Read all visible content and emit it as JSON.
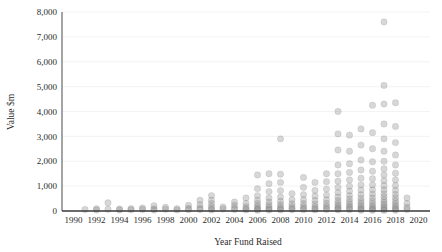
{
  "chart_data": {
    "type": "scatter",
    "title": "",
    "subtitle": "",
    "xlabel": "Year Fund Raised",
    "ylabel": "Value $m",
    "xlim": [
      1989,
      2021
    ],
    "ylim": [
      0,
      8000
    ],
    "xticks": [
      1990,
      1992,
      1994,
      1996,
      1998,
      2000,
      2002,
      2004,
      2006,
      2008,
      2010,
      2012,
      2014,
      2016,
      2018,
      2020
    ],
    "xtick_labels": [
      "1990",
      "1992",
      "1994",
      "1996",
      "1998",
      "2000",
      "2002",
      "2004",
      "2006",
      "2008",
      "2010",
      "2012",
      "2014",
      "2016",
      "2018",
      "2020"
    ],
    "yticks": [
      0,
      1000,
      2000,
      3000,
      4000,
      5000,
      6000,
      7000,
      8000
    ],
    "ytick_labels": [
      "0",
      "1,000",
      "2,000",
      "3,000",
      "4,000",
      "5,000",
      "6,000",
      "7,000",
      "8,000"
    ],
    "grid": true,
    "grid_axis": "y",
    "legend": false,
    "legend_position": "none",
    "marker": {
      "shape": "circle",
      "radius": 3.2,
      "fill": "#8a8a8a",
      "fill_opacity": 0.34,
      "stroke": "#707070"
    },
    "colors": {
      "marker": "#8a8a8a",
      "axis": "#3a3a3a",
      "grid": "#f0f0f0",
      "text": "#2b2b2b",
      "background": "#ffffff"
    },
    "series": [
      {
        "name": "Funds",
        "points": [
          [
            1991,
            60
          ],
          [
            1992,
            90
          ],
          [
            1992,
            40
          ],
          [
            1993,
            330
          ],
          [
            1993,
            70
          ],
          [
            1994,
            80
          ],
          [
            1994,
            45
          ],
          [
            1995,
            95
          ],
          [
            1995,
            50
          ],
          [
            1996,
            120
          ],
          [
            1996,
            60
          ],
          [
            1997,
            210
          ],
          [
            1997,
            80
          ],
          [
            1997,
            40
          ],
          [
            1998,
            150
          ],
          [
            1998,
            70
          ],
          [
            1999,
            95
          ],
          [
            1999,
            45
          ],
          [
            2000,
            230
          ],
          [
            2000,
            110
          ],
          [
            2000,
            55
          ],
          [
            2001,
            430
          ],
          [
            2001,
            250
          ],
          [
            2001,
            120
          ],
          [
            2001,
            60
          ],
          [
            2002,
            620
          ],
          [
            2002,
            430
          ],
          [
            2002,
            300
          ],
          [
            2002,
            180
          ],
          [
            2002,
            90
          ],
          [
            2002,
            45
          ],
          [
            2003,
            160
          ],
          [
            2003,
            80
          ],
          [
            2004,
            360
          ],
          [
            2004,
            230
          ],
          [
            2004,
            120
          ],
          [
            2004,
            60
          ],
          [
            2005,
            520
          ],
          [
            2005,
            300
          ],
          [
            2005,
            170
          ],
          [
            2005,
            90
          ],
          [
            2005,
            45
          ],
          [
            2006,
            1450
          ],
          [
            2006,
            900
          ],
          [
            2006,
            620
          ],
          [
            2006,
            430
          ],
          [
            2006,
            300
          ],
          [
            2006,
            200
          ],
          [
            2006,
            120
          ],
          [
            2006,
            70
          ],
          [
            2006,
            35
          ],
          [
            2007,
            1500
          ],
          [
            2007,
            1100
          ],
          [
            2007,
            780
          ],
          [
            2007,
            520
          ],
          [
            2007,
            360
          ],
          [
            2007,
            240
          ],
          [
            2007,
            150
          ],
          [
            2007,
            80
          ],
          [
            2007,
            40
          ],
          [
            2008,
            2900
          ],
          [
            2008,
            1480
          ],
          [
            2008,
            1150
          ],
          [
            2008,
            820
          ],
          [
            2008,
            560
          ],
          [
            2008,
            390
          ],
          [
            2008,
            260
          ],
          [
            2008,
            160
          ],
          [
            2008,
            90
          ],
          [
            2008,
            45
          ],
          [
            2009,
            700
          ],
          [
            2009,
            450
          ],
          [
            2009,
            290
          ],
          [
            2009,
            180
          ],
          [
            2009,
            100
          ],
          [
            2009,
            50
          ],
          [
            2010,
            1350
          ],
          [
            2010,
            950
          ],
          [
            2010,
            660
          ],
          [
            2010,
            450
          ],
          [
            2010,
            300
          ],
          [
            2010,
            190
          ],
          [
            2010,
            110
          ],
          [
            2010,
            55
          ],
          [
            2011,
            1150
          ],
          [
            2011,
            830
          ],
          [
            2011,
            600
          ],
          [
            2011,
            420
          ],
          [
            2011,
            280
          ],
          [
            2011,
            170
          ],
          [
            2011,
            95
          ],
          [
            2011,
            45
          ],
          [
            2012,
            1500
          ],
          [
            2012,
            1180
          ],
          [
            2012,
            880
          ],
          [
            2012,
            640
          ],
          [
            2012,
            450
          ],
          [
            2012,
            310
          ],
          [
            2012,
            200
          ],
          [
            2012,
            120
          ],
          [
            2012,
            60
          ],
          [
            2013,
            4000
          ],
          [
            2013,
            3100
          ],
          [
            2013,
            2450
          ],
          [
            2013,
            1850
          ],
          [
            2013,
            1500
          ],
          [
            2013,
            1200
          ],
          [
            2013,
            950
          ],
          [
            2013,
            740
          ],
          [
            2013,
            560
          ],
          [
            2013,
            420
          ],
          [
            2013,
            310
          ],
          [
            2013,
            220
          ],
          [
            2013,
            150
          ],
          [
            2013,
            90
          ],
          [
            2013,
            45
          ],
          [
            2014,
            3050
          ],
          [
            2014,
            2400
          ],
          [
            2014,
            1900
          ],
          [
            2014,
            1550
          ],
          [
            2014,
            1250
          ],
          [
            2014,
            1000
          ],
          [
            2014,
            800
          ],
          [
            2014,
            620
          ],
          [
            2014,
            480
          ],
          [
            2014,
            360
          ],
          [
            2014,
            260
          ],
          [
            2014,
            180
          ],
          [
            2014,
            110
          ],
          [
            2014,
            55
          ],
          [
            2015,
            3300
          ],
          [
            2015,
            2650
          ],
          [
            2015,
            2050
          ],
          [
            2015,
            1650
          ],
          [
            2015,
            1320
          ],
          [
            2015,
            1050
          ],
          [
            2015,
            840
          ],
          [
            2015,
            660
          ],
          [
            2015,
            510
          ],
          [
            2015,
            390
          ],
          [
            2015,
            290
          ],
          [
            2015,
            200
          ],
          [
            2015,
            130
          ],
          [
            2015,
            70
          ],
          [
            2015,
            30
          ],
          [
            2016,
            4250
          ],
          [
            2016,
            3150
          ],
          [
            2016,
            2500
          ],
          [
            2016,
            1980
          ],
          [
            2016,
            1600
          ],
          [
            2016,
            1300
          ],
          [
            2016,
            1050
          ],
          [
            2016,
            850
          ],
          [
            2016,
            680
          ],
          [
            2016,
            530
          ],
          [
            2016,
            400
          ],
          [
            2016,
            290
          ],
          [
            2016,
            200
          ],
          [
            2016,
            130
          ],
          [
            2016,
            70
          ],
          [
            2016,
            30
          ],
          [
            2017,
            7600
          ],
          [
            2017,
            5050
          ],
          [
            2017,
            4300
          ],
          [
            2017,
            3500
          ],
          [
            2017,
            2900
          ],
          [
            2017,
            2400
          ],
          [
            2017,
            2000
          ],
          [
            2017,
            1700
          ],
          [
            2017,
            1450
          ],
          [
            2017,
            1220
          ],
          [
            2017,
            1020
          ],
          [
            2017,
            850
          ],
          [
            2017,
            700
          ],
          [
            2017,
            570
          ],
          [
            2017,
            450
          ],
          [
            2017,
            350
          ],
          [
            2017,
            260
          ],
          [
            2017,
            185
          ],
          [
            2017,
            120
          ],
          [
            2017,
            65
          ],
          [
            2017,
            25
          ],
          [
            2018,
            4350
          ],
          [
            2018,
            3400
          ],
          [
            2018,
            2750
          ],
          [
            2018,
            2250
          ],
          [
            2018,
            1850
          ],
          [
            2018,
            1520
          ],
          [
            2018,
            1250
          ],
          [
            2018,
            1020
          ],
          [
            2018,
            830
          ],
          [
            2018,
            670
          ],
          [
            2018,
            530
          ],
          [
            2018,
            410
          ],
          [
            2018,
            305
          ],
          [
            2018,
            215
          ],
          [
            2018,
            140
          ],
          [
            2018,
            75
          ],
          [
            2018,
            30
          ],
          [
            2019,
            520
          ],
          [
            2019,
            300
          ],
          [
            2019,
            150
          ],
          [
            2019,
            60
          ]
        ]
      }
    ]
  },
  "axes": {
    "y_title": "Value $m",
    "x_title": "Year Fund Raised"
  }
}
